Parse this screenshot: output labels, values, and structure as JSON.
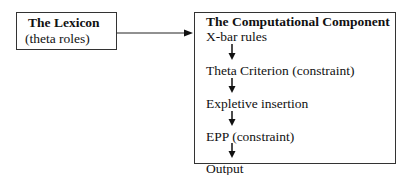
{
  "lexicon": {
    "title": "The Lexicon",
    "subtitle": "(theta roles)"
  },
  "computational_component": {
    "title": "The Computational Component",
    "steps": [
      "X-bar rules",
      "Theta Criterion (constraint)",
      "Expletive insertion",
      "EPP (constraint)",
      "Output"
    ]
  }
}
